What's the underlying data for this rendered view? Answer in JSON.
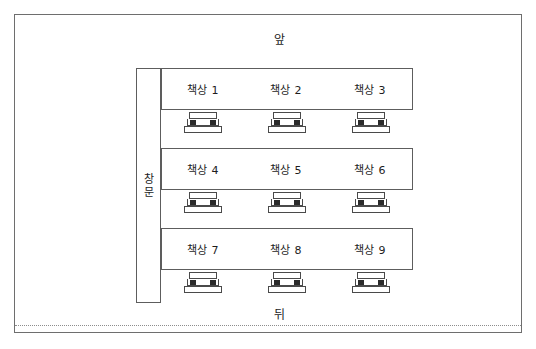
{
  "diagram": {
    "title_front": "앞",
    "title_back": "뒤",
    "window": {
      "name": "창문",
      "chars": [
        "창",
        "문"
      ]
    },
    "rows": [
      {
        "seats": [
          {
            "desk_label": "책상 1",
            "chair": "chair-icon"
          },
          {
            "desk_label": "책상 2",
            "chair": "chair-icon"
          },
          {
            "desk_label": "책상 3",
            "chair": "chair-icon"
          }
        ]
      },
      {
        "seats": [
          {
            "desk_label": "책상 4",
            "chair": "chair-icon"
          },
          {
            "desk_label": "책상 5",
            "chair": "chair-icon"
          },
          {
            "desk_label": "책상 6",
            "chair": "chair-icon"
          }
        ]
      },
      {
        "seats": [
          {
            "desk_label": "책상 7",
            "chair": "chair-icon"
          },
          {
            "desk_label": "책상 8",
            "chair": "chair-icon"
          },
          {
            "desk_label": "책상 9",
            "chair": "chair-icon"
          }
        ]
      }
    ],
    "colors": {
      "frame_border": "#6e6e6e",
      "object_border": "#5d5d5d",
      "chair_peg": "#2b2b2b",
      "text": "#1d1d1d",
      "background": "#ffffff"
    }
  }
}
